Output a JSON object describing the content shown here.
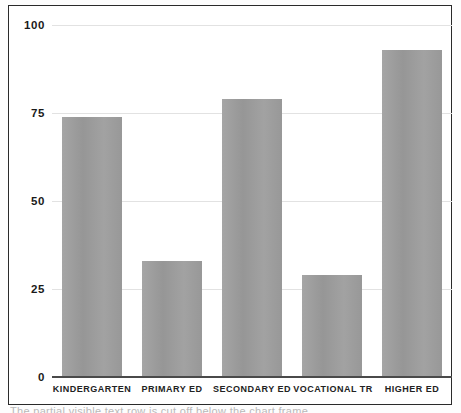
{
  "chart_data": {
    "type": "bar",
    "title": "",
    "subtitle": "",
    "xlabel": "",
    "ylabel": "",
    "categories": [
      "Kindergarten",
      "Primary Ed",
      "Secondary Ed",
      "Vocational Tr",
      "Higher Ed"
    ],
    "values": [
      74,
      33,
      79,
      29,
      93
    ],
    "ylim": [
      0,
      100
    ],
    "yticks": [
      0,
      25,
      50,
      75,
      100
    ],
    "ytick_labels": [
      "0",
      "25",
      "50",
      "75",
      "100"
    ],
    "grid": true,
    "grid_axis": "y",
    "legend": false,
    "legend_position": "none",
    "series": [
      {
        "name": "Enrollment",
        "values": [
          74,
          33,
          79,
          29,
          93
        ]
      }
    ],
    "bar_color": "#9b9b9b",
    "gridline_color": "#e2e2e2",
    "axis_color": "#4a4a4a",
    "frame_color": "#2a2a2a",
    "background_color": "#ffffff"
  },
  "caption": {
    "clipped_text": "The partial visible text row is cut off below the chart frame"
  }
}
